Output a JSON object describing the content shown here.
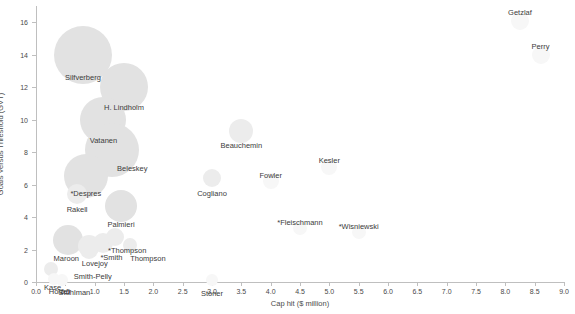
{
  "chart_data": {
    "type": "scatter",
    "title": "",
    "xlabel": "Cap hit ($ million)",
    "ylabel": "Goals Versus Threshold (GVT)",
    "xlim": [
      0.0,
      9.0
    ],
    "ylim": [
      0,
      17
    ],
    "grid": false,
    "legend": "none",
    "bubble_note": "marker area encodes a third variable; larger bubble = larger value",
    "xticks": [
      "0.0",
      "0.5",
      "1.0",
      "1.5",
      "2.0",
      "2.5",
      "3.0",
      "3.5",
      "4.0",
      "4.5",
      "5.0",
      "5.5",
      "6.0",
      "6.5",
      "7.0",
      "7.5",
      "8.0",
      "8.5",
      "9.0"
    ],
    "yticks": [
      "0",
      "2",
      "4",
      "6",
      "8",
      "10",
      "12",
      "14",
      "16"
    ],
    "points": [
      {
        "label": "Getzlaf",
        "x": 8.25,
        "y": 16.1,
        "size": 9,
        "shade": "faint",
        "label_dx": 0,
        "label_dy": -13
      },
      {
        "label": "Perry",
        "x": 8.6,
        "y": 14.0,
        "size": 9,
        "shade": "faint",
        "label_dx": 0,
        "label_dy": -13
      },
      {
        "label": "Silfverberg",
        "x": 0.8,
        "y": 14.0,
        "size": 29,
        "shade": "normal",
        "label_dx": 0,
        "label_dy": 18
      },
      {
        "label": "H. Lindholm",
        "x": 1.5,
        "y": 12.0,
        "size": 24,
        "shade": "normal",
        "label_dx": 0,
        "label_dy": 16
      },
      {
        "label": "Vatanen",
        "x": 1.15,
        "y": 10.0,
        "size": 23,
        "shade": "normal",
        "label_dx": 0,
        "label_dy": 16
      },
      {
        "label": "Beauchemin",
        "x": 3.5,
        "y": 9.3,
        "size": 12,
        "shade": "mid",
        "label_dx": 0,
        "label_dy": 10
      },
      {
        "label": "Beleskey",
        "x": 1.3,
        "y": 8.1,
        "size": 27,
        "shade": "normal",
        "label_dx": 20,
        "label_dy": 14
      },
      {
        "label": "Kesler",
        "x": 5.0,
        "y": 7.1,
        "size": 8,
        "shade": "faint",
        "label_dx": 0,
        "label_dy": -11
      },
      {
        "label": "*Despres",
        "x": 0.85,
        "y": 6.5,
        "size": 22,
        "shade": "normal",
        "label_dx": 0,
        "label_dy": 13
      },
      {
        "label": "Cogliano",
        "x": 3.0,
        "y": 6.4,
        "size": 9,
        "shade": "mid",
        "label_dx": 0,
        "label_dy": 11
      },
      {
        "label": "Fowler",
        "x": 4.0,
        "y": 6.2,
        "size": 8,
        "shade": "faint",
        "label_dx": 0,
        "label_dy": -10
      },
      {
        "label": "Rakell",
        "x": 0.7,
        "y": 5.4,
        "size": 10,
        "shade": "mid",
        "label_dx": 0,
        "label_dy": 11
      },
      {
        "label": "Palmieri",
        "x": 1.45,
        "y": 4.7,
        "size": 16,
        "shade": "normal",
        "label_dx": 0,
        "label_dy": 14
      },
      {
        "label": "*Fleischmann",
        "x": 4.5,
        "y": 3.3,
        "size": 7,
        "shade": "faint",
        "label_dx": 0,
        "label_dy": -10
      },
      {
        "label": "*Wisniewski",
        "x": 5.5,
        "y": 3.1,
        "size": 7,
        "shade": "faint",
        "label_dx": 0,
        "label_dy": -10
      },
      {
        "label": "Maroon",
        "x": 0.55,
        "y": 2.6,
        "size": 15,
        "shade": "normal",
        "label_dx": -2,
        "label_dy": 14
      },
      {
        "label": "Lovejoy",
        "x": 0.9,
        "y": 2.2,
        "size": 11,
        "shade": "mid",
        "label_dx": 6,
        "label_dy": 13
      },
      {
        "label": "Smith-Pelly",
        "x": 0.9,
        "y": 2.0,
        "size": 9,
        "shade": "mid",
        "label_dx": 4,
        "label_dy": 22
      },
      {
        "label": "*Smith",
        "x": 1.15,
        "y": 2.4,
        "size": 10,
        "shade": "mid",
        "label_dx": 8,
        "label_dy": 10
      },
      {
        "label": "*Thompson",
        "x": 1.35,
        "y": 2.8,
        "size": 9,
        "shade": "mid",
        "label_dx": 12,
        "label_dy": 9
      },
      {
        "label": "Thompson",
        "x": 1.6,
        "y": 2.3,
        "size": 7,
        "shade": "mid",
        "label_dx": 18,
        "label_dy": 9
      },
      {
        "label": "Stoner",
        "x": 3.0,
        "y": 0.15,
        "size": 6,
        "shade": "faint",
        "label_dx": 0,
        "label_dy": 9
      },
      {
        "label": "Kase",
        "x": 0.25,
        "y": 0.8,
        "size": 7,
        "shade": "mid",
        "label_dx": 2,
        "label_dy": 14
      },
      {
        "label": "Holzer",
        "x": 0.3,
        "y": 0.2,
        "size": 6,
        "shade": "faint",
        "label_dx": 6,
        "label_dy": 8
      },
      {
        "label": "Stuhlman",
        "x": 0.45,
        "y": 0.1,
        "size": 6,
        "shade": "faint",
        "label_dx": 12,
        "label_dy": 8
      }
    ]
  }
}
